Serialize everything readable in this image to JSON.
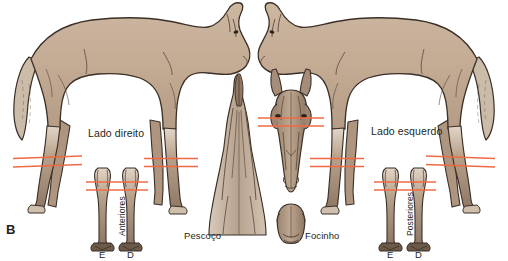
{
  "figure": {
    "panel_label": "B",
    "colors": {
      "body_fill": "#c4ac95",
      "body_fill_light": "#d9c9b8",
      "body_fill_dark": "#9d8булка",
      "outline": "#3b2f27",
      "measure_line": "#ef6a43",
      "text": "#231f20",
      "background": "#ffffff"
    },
    "labels": {
      "right_side": "Lado direito",
      "left_side": "Lado esquerdo",
      "neck": "Pescoço",
      "muzzle": "Focinho",
      "forelimbs": "Anteriores",
      "hindlimbs": "Posteriores",
      "left_mark": "E",
      "right_mark": "D"
    },
    "views": [
      {
        "name": "horse-right-side",
        "description": "full lateral body view facing right"
      },
      {
        "name": "horse-left-side",
        "description": "full lateral body view facing left"
      },
      {
        "name": "neck-dorsal",
        "description": "neck seen from above"
      },
      {
        "name": "head-frontal",
        "description": "head seen from front"
      },
      {
        "name": "muzzle-frontal",
        "description": "muzzle close view"
      },
      {
        "name": "forelimbs-frontal",
        "description": "pair of front limbs, E and D"
      },
      {
        "name": "hindlimbs-frontal",
        "description": "pair of hind limbs, E and D"
      }
    ],
    "measure_line_count": 2
  }
}
